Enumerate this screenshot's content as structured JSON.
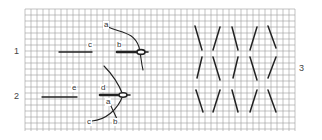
{
  "figure_labels": {
    "fig1": "1",
    "fig2": "2",
    "fig3": "3"
  },
  "figure1_points": {
    "a": "a",
    "b": "b",
    "c": "c"
  },
  "figure2_points": {
    "a": "a",
    "b": "b",
    "c": "c",
    "d": "d",
    "e": "e"
  },
  "grid": {
    "left": 25,
    "top": 9,
    "right": 295,
    "bottom": 131,
    "cell": 6,
    "line_color": "#9a9a9a"
  },
  "stroke_color": "#222222",
  "figure3_stitches": [
    [
      [
        195,
        26
      ],
      [
        202,
        50
      ]
    ],
    [
      [
        220,
        27
      ],
      [
        213,
        50
      ]
    ],
    [
      [
        232,
        27
      ],
      [
        238,
        50
      ]
    ],
    [
      [
        257,
        27
      ],
      [
        250,
        50
      ]
    ],
    [
      [
        268,
        26
      ],
      [
        276,
        48
      ]
    ],
    [
      [
        202,
        57
      ],
      [
        197,
        78
      ]
    ],
    [
      [
        213,
        57
      ],
      [
        220,
        80
      ]
    ],
    [
      [
        238,
        57
      ],
      [
        233,
        78
      ]
    ],
    [
      [
        250,
        57
      ],
      [
        257,
        80
      ]
    ],
    [
      [
        276,
        57
      ],
      [
        268,
        78
      ]
    ],
    [
      [
        196,
        90
      ],
      [
        203,
        112
      ]
    ],
    [
      [
        220,
        90
      ],
      [
        213,
        112
      ]
    ],
    [
      [
        232,
        90
      ],
      [
        238,
        112
      ]
    ],
    [
      [
        257,
        90
      ],
      [
        250,
        112
      ]
    ],
    [
      [
        268,
        90
      ],
      [
        276,
        112
      ]
    ]
  ]
}
